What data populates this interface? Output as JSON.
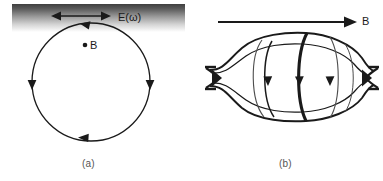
{
  "figure": {
    "panels": [
      {
        "id": "a",
        "caption": "(a)",
        "labels": {
          "field": "E(ω)",
          "point": "B"
        },
        "description": "circular current loop beneath a shaded boundary layer with oscillating electric field",
        "circle": {
          "cx": 91,
          "cy": 82,
          "r": 59
        },
        "gradient_band": {
          "x": 12,
          "y": 4,
          "width": 173,
          "height": 28,
          "top_color": "#4a4a4a",
          "bottom_color": "#ffffff"
        },
        "double_arrow": {
          "x1": 52,
          "x2": 110,
          "y": 16
        },
        "loop_arrowheads": [
          {
            "position": "top",
            "direction": "left"
          },
          {
            "position": "right",
            "direction": "down"
          },
          {
            "position": "bottom",
            "direction": "left"
          },
          {
            "position": "left",
            "direction": "down"
          }
        ]
      },
      {
        "id": "b",
        "caption": "(b)",
        "labels": {
          "field": "B"
        },
        "description": "magnetic bottle spindle with pinched cusps and nested current loops",
        "spindle": {
          "x_left": 208,
          "x_right": 375,
          "y_top": 33,
          "y_bottom": 120,
          "y_axis": 78
        },
        "field_arrow": {
          "x1": 218,
          "x2": 356,
          "y": 22
        },
        "loop_arrowheads": [
          {
            "x": 272,
            "y": 80,
            "direction": "down"
          },
          {
            "x": 303,
            "y": 80,
            "direction": "down"
          },
          {
            "x": 331,
            "y": 80,
            "direction": "down"
          }
        ]
      }
    ],
    "colors": {
      "stroke": "#1a1a1a",
      "thin_stroke": "#4d4d4d",
      "background": "#ffffff",
      "caption": "#555555"
    }
  }
}
